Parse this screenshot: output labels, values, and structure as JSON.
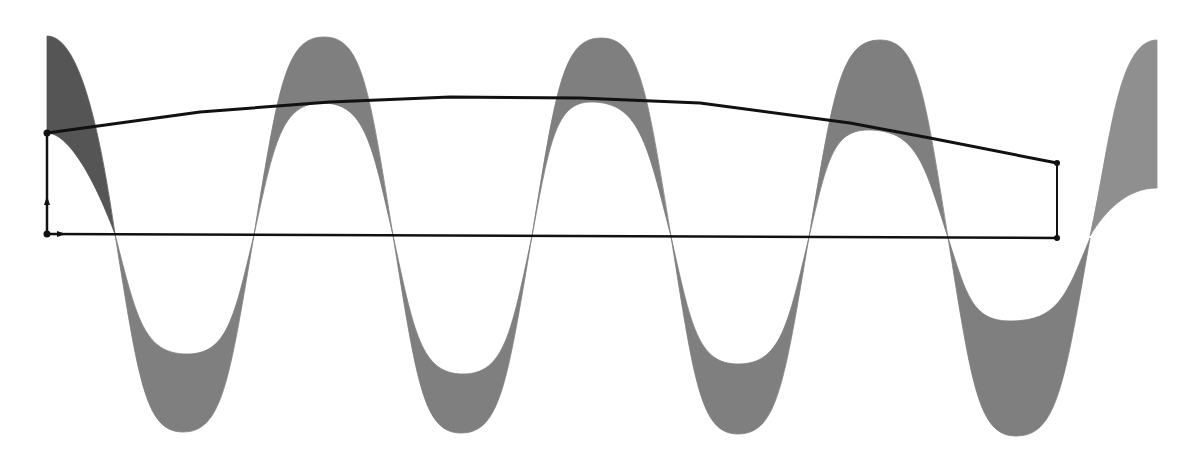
{
  "diagram": {
    "colors": {
      "background": "#ffffff",
      "band_first": "#555555",
      "band": "#7f7f7f",
      "band_last": "#8f8f8f",
      "frame": "#111111",
      "node": "#111111"
    },
    "baseline": {
      "x1": 47,
      "y1": 234,
      "x2": 1057,
      "y2": 238
    },
    "frame": {
      "nodes": [
        {
          "id": "top-left",
          "x": 47,
          "y": 133
        },
        {
          "id": "bottom-left",
          "x": 47,
          "y": 234
        },
        {
          "id": "bottom-right",
          "x": 1057,
          "y": 238
        },
        {
          "id": "top-right",
          "x": 1057,
          "y": 163
        }
      ],
      "top_curve_points": [
        [
          47,
          133
        ],
        [
          200,
          112
        ],
        [
          330,
          102
        ],
        [
          450,
          97
        ],
        [
          580,
          98
        ],
        [
          700,
          103
        ],
        [
          850,
          123
        ],
        [
          930,
          138
        ],
        [
          1057,
          163
        ]
      ],
      "arrows": [
        {
          "name": "up-arrow",
          "x": 47,
          "y": 200,
          "direction": "up"
        },
        {
          "name": "right-arrow",
          "x": 62,
          "y": 234,
          "direction": "right"
        }
      ]
    },
    "band_lobes": [
      {
        "type": "start",
        "x0": 47,
        "outer_y": 36,
        "inner_y": 133,
        "cross_x": 115,
        "cross_y": 234
      },
      {
        "type": "trough",
        "from_x": 115,
        "to_x": 254,
        "outer": [
          183,
          432
        ],
        "inner": [
          187,
          354
        ]
      },
      {
        "type": "peak",
        "from_x": 254,
        "to_x": 393,
        "outer": [
          324,
          37
        ],
        "inner": [
          322,
          103
        ]
      },
      {
        "type": "trough",
        "from_x": 393,
        "to_x": 532,
        "outer": [
          461,
          433
        ],
        "inner": [
          463,
          374
        ]
      },
      {
        "type": "peak",
        "from_x": 532,
        "to_x": 671,
        "outer": [
          601,
          38
        ],
        "inner": [
          591,
          102
        ]
      },
      {
        "type": "trough",
        "from_x": 671,
        "to_x": 809,
        "outer": [
          738,
          434
        ],
        "inner": [
          738,
          364
        ]
      },
      {
        "type": "peak",
        "from_x": 809,
        "to_x": 948,
        "outer": [
          880,
          40
        ],
        "inner": [
          868,
          130
        ]
      },
      {
        "type": "trough",
        "from_x": 948,
        "to_x": 1090,
        "outer": [
          1016,
          436
        ],
        "inner": [
          1010,
          321
        ]
      },
      {
        "type": "end",
        "cross_x": 1090,
        "cross_y": 236,
        "x1": 1157,
        "outer_y": 40,
        "inner_y": 188
      }
    ]
  }
}
